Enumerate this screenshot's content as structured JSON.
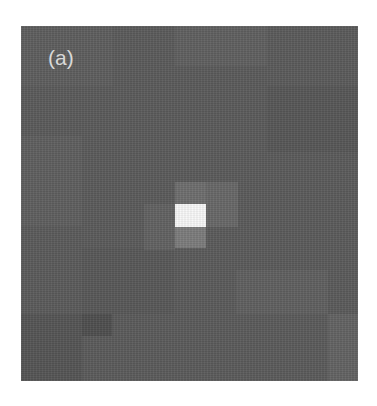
{
  "figure": {
    "panel_label": "(a)",
    "background_color": "#5b5b5b",
    "grid": {
      "columns": 11,
      "rows": 16,
      "cell_width_px": 30.6,
      "cell_height_px": 22.2
    },
    "bright_cells": [
      {
        "name": "center-peak",
        "x": 154,
        "y": 178,
        "w": 31,
        "h": 23,
        "color": "#f8f8f8"
      },
      {
        "name": "halo-above",
        "x": 154,
        "y": 156,
        "w": 31,
        "h": 22,
        "color": "#6e6e6e"
      },
      {
        "name": "halo-right",
        "x": 185,
        "y": 156,
        "w": 32,
        "h": 45,
        "color": "#686868"
      },
      {
        "name": "halo-below",
        "x": 154,
        "y": 201,
        "w": 31,
        "h": 21,
        "color": "#7c7c7c"
      },
      {
        "name": "halo-left",
        "x": 123,
        "y": 178,
        "w": 31,
        "h": 46,
        "color": "#626262"
      }
    ],
    "background_blocks": [
      {
        "x": 0,
        "y": 0,
        "w": 92,
        "h": 60,
        "color": "#5e5e5e"
      },
      {
        "x": 154,
        "y": 0,
        "w": 92,
        "h": 40,
        "color": "#606060"
      },
      {
        "x": 246,
        "y": 60,
        "w": 91,
        "h": 66,
        "color": "#575757"
      },
      {
        "x": 0,
        "y": 110,
        "w": 61,
        "h": 90,
        "color": "#5f5f5f"
      },
      {
        "x": 61,
        "y": 222,
        "w": 92,
        "h": 66,
        "color": "#585858"
      },
      {
        "x": 0,
        "y": 288,
        "w": 61,
        "h": 67,
        "color": "#555555"
      },
      {
        "x": 215,
        "y": 244,
        "w": 92,
        "h": 44,
        "color": "#606060"
      },
      {
        "x": 307,
        "y": 288,
        "w": 30,
        "h": 67,
        "color": "#636363"
      },
      {
        "x": 61,
        "y": 288,
        "w": 30,
        "h": 22,
        "color": "#4f4f4f"
      }
    ]
  }
}
